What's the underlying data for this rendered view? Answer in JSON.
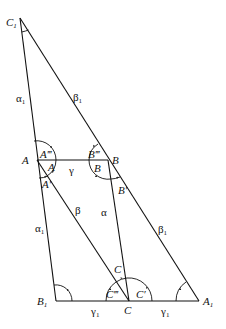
{
  "diagram": {
    "type": "geometry-triangles",
    "points": {
      "C1": {
        "label": "C",
        "sub": "1",
        "x": 20,
        "y": 18
      },
      "A": {
        "label": "A",
        "x": 37,
        "y": 160
      },
      "B": {
        "label": "B",
        "x": 108,
        "y": 160
      },
      "B1": {
        "label": "B",
        "sub": "1",
        "x": 56,
        "y": 301
      },
      "C": {
        "label": "C",
        "x": 129,
        "y": 301
      },
      "A1": {
        "label": "A",
        "sub": "1",
        "x": 199,
        "y": 301
      }
    },
    "side_labels": {
      "alpha1_upper": {
        "text": "α",
        "sub": "1"
      },
      "beta1_upper": {
        "text": "β",
        "sub": "1"
      },
      "gamma": {
        "text": "γ"
      },
      "alpha1_lower": {
        "text": "α",
        "sub": "1"
      },
      "beta": {
        "text": "β"
      },
      "alpha": {
        "text": "α"
      },
      "beta1_lower": {
        "text": "β",
        "sub": "1"
      },
      "gamma1_left": {
        "text": "γ",
        "sub": "1"
      },
      "gamma1_right": {
        "text": "γ",
        "sub": "1"
      }
    },
    "angle_labels": {
      "A_triple": "A‴",
      "A": "A",
      "A_prime": "A′",
      "B_triple": "B‴",
      "B": "B",
      "B_prime": "B′",
      "C_top": "C",
      "C_triple": "C‴",
      "C_prime": "C′"
    }
  }
}
